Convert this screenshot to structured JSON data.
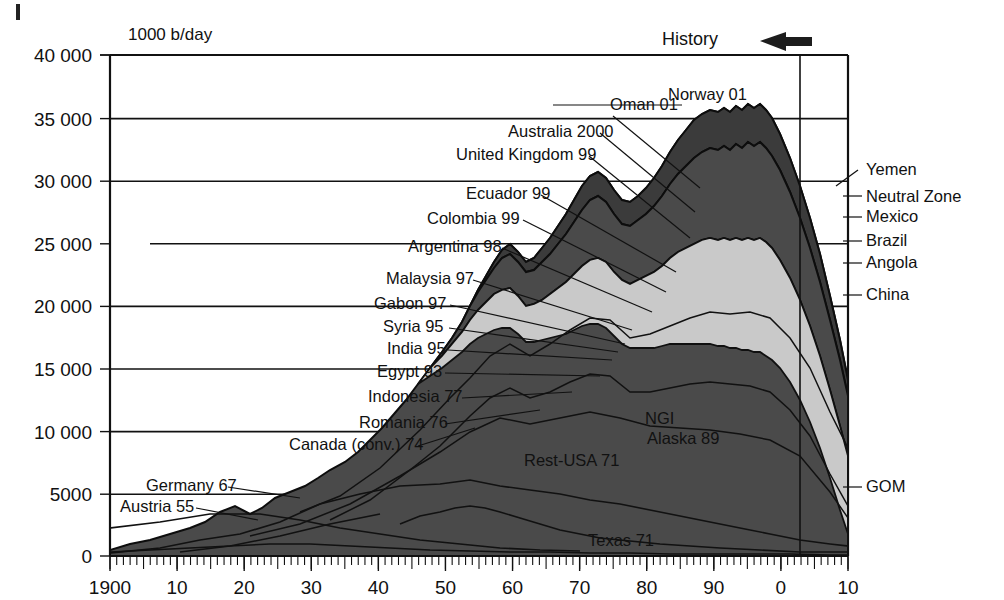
{
  "figure": {
    "axis_unit_label": "1000 b/day",
    "history_label": "History",
    "history_arrow_icon": "left-arrow-icon",
    "caption": ""
  },
  "chart_data": {
    "type": "area",
    "title": "",
    "subtitle": "",
    "xlabel": "",
    "ylabel": "1000 b/day",
    "ylim": [
      0,
      40000
    ],
    "xlim": [
      1900,
      2010
    ],
    "grid": true,
    "legend_position": "inline-callouts",
    "ytick_labels": [
      "0",
      "5000",
      "10 000",
      "15 000",
      "20 000",
      "25 000",
      "30 000",
      "35 000",
      "40 000"
    ],
    "ytick_values": [
      0,
      5000,
      10000,
      15000,
      20000,
      25000,
      30000,
      35000,
      40000
    ],
    "xtick_labels": [
      "1900",
      "10",
      "20",
      "30",
      "40",
      "50",
      "60",
      "70",
      "80",
      "90",
      "0",
      "10"
    ],
    "xtick_values": [
      1900,
      1910,
      1920,
      1930,
      1940,
      1950,
      1960,
      1970,
      1980,
      1990,
      2000,
      2010
    ],
    "minor_tick_interval_years": 1,
    "history_divider_year": 2003,
    "annotation_note": "Stacked world oil production by region with peak year labels",
    "left_callouts": [
      {
        "label": "Oman 01",
        "x": 610,
        "y": 110
      },
      {
        "label": "Australia 2000",
        "x": 508,
        "y": 137
      },
      {
        "label": "United Kingdom 99",
        "x": 456,
        "y": 160
      },
      {
        "label": "Ecuador 99",
        "x": 466,
        "y": 199
      },
      {
        "label": "Colombia 99",
        "x": 427,
        "y": 224
      },
      {
        "label": "Argentina 98",
        "x": 408,
        "y": 252
      },
      {
        "label": "Malaysia 97",
        "x": 386,
        "y": 284
      },
      {
        "label": "Gabon 97",
        "x": 374,
        "y": 309
      },
      {
        "label": "Syria 95",
        "x": 383,
        "y": 332
      },
      {
        "label": "India 95",
        "x": 387,
        "y": 354
      },
      {
        "label": "Egypt 93",
        "x": 377,
        "y": 377
      },
      {
        "label": "Indonesia 77",
        "x": 368,
        "y": 402
      },
      {
        "label": "Romania 76",
        "x": 359,
        "y": 428
      },
      {
        "label": "Canada (conv.) 74",
        "x": 289,
        "y": 450
      },
      {
        "label": "Germany 67",
        "x": 146,
        "y": 491
      },
      {
        "label": "Austria 55",
        "x": 120,
        "y": 512
      }
    ],
    "top_callouts": [
      {
        "label": "Norway 01",
        "x": 668,
        "y": 100
      }
    ],
    "inner_labels": [
      {
        "label": "NGI",
        "x": 645,
        "y": 424
      },
      {
        "label": "Alaska 89",
        "x": 647,
        "y": 444
      },
      {
        "label": "Rest-USA 71",
        "x": 524,
        "y": 466
      },
      {
        "label": "Texas 71",
        "x": 588,
        "y": 546
      }
    ],
    "right_labels": [
      {
        "label": "Yemen",
        "x": 866,
        "y": 175
      },
      {
        "label": "Neutral Zone",
        "x": 866,
        "y": 202
      },
      {
        "label": "Mexico",
        "x": 866,
        "y": 222
      },
      {
        "label": "Brazil",
        "x": 866,
        "y": 246
      },
      {
        "label": "Angola",
        "x": 866,
        "y": 268
      },
      {
        "label": "China",
        "x": 866,
        "y": 300
      },
      {
        "label": "GOM",
        "x": 866,
        "y": 492
      }
    ],
    "series": [
      {
        "name": "Texas 71",
        "peak_year": 1971,
        "peak_value": 3600
      },
      {
        "name": "Rest-USA 71",
        "peak_year": 1971,
        "peak_value": 4900
      },
      {
        "name": "Alaska 89",
        "peak_year": 1989,
        "peak_value": 2000
      },
      {
        "name": "NGI",
        "peak_year": 1985,
        "peak_value": 900
      },
      {
        "name": "GOM",
        "peak_year": 2003,
        "peak_value": 1500
      },
      {
        "name": "Austria 55",
        "peak_year": 1955,
        "peak_value": 60
      },
      {
        "name": "Germany 67",
        "peak_year": 1967,
        "peak_value": 160
      },
      {
        "name": "Canada (conv.) 74",
        "peak_year": 1974,
        "peak_value": 1800
      },
      {
        "name": "Romania 76",
        "peak_year": 1976,
        "peak_value": 310
      },
      {
        "name": "Indonesia 77",
        "peak_year": 1977,
        "peak_value": 1700
      },
      {
        "name": "Egypt 93",
        "peak_year": 1993,
        "peak_value": 940
      },
      {
        "name": "India 95",
        "peak_year": 1995,
        "peak_value": 780
      },
      {
        "name": "Syria 95",
        "peak_year": 1995,
        "peak_value": 600
      },
      {
        "name": "Gabon 97",
        "peak_year": 1997,
        "peak_value": 370
      },
      {
        "name": "Malaysia 97",
        "peak_year": 1997,
        "peak_value": 720
      },
      {
        "name": "Argentina 98",
        "peak_year": 1998,
        "peak_value": 900
      },
      {
        "name": "Colombia 99",
        "peak_year": 1999,
        "peak_value": 820
      },
      {
        "name": "Ecuador 99",
        "peak_year": 1999,
        "peak_value": 390
      },
      {
        "name": "United Kingdom 99",
        "peak_year": 1999,
        "peak_value": 2900
      },
      {
        "name": "Australia 2000",
        "peak_year": 2000,
        "peak_value": 800
      },
      {
        "name": "Oman 01",
        "peak_year": 2001,
        "peak_value": 960
      },
      {
        "name": "Norway 01",
        "peak_year": 2001,
        "peak_value": 3400
      },
      {
        "name": "China",
        "peak_year": 2003,
        "peak_value": 3400
      },
      {
        "name": "Angola",
        "peak_year": 2010,
        "peak_value": 1900
      },
      {
        "name": "Brazil",
        "peak_year": 2010,
        "peak_value": 2100
      },
      {
        "name": "Mexico",
        "peak_year": 2004,
        "peak_value": 3400
      },
      {
        "name": "Neutral Zone",
        "peak_year": 2005,
        "peak_value": 600
      },
      {
        "name": "Yemen",
        "peak_year": 2002,
        "peak_value": 450
      }
    ],
    "total_stack": {
      "x": [
        1900,
        1905,
        1910,
        1915,
        1920,
        1925,
        1930,
        1935,
        1940,
        1945,
        1950,
        1955,
        1960,
        1965,
        1970,
        1973,
        1975,
        1979,
        1982,
        1985,
        1988,
        1990,
        1993,
        1996,
        1999,
        2001,
        2003,
        2005,
        2007,
        2010
      ],
      "y": [
        420,
        700,
        1050,
        1250,
        1900,
        2700,
        3900,
        4200,
        5600,
        5800,
        9500,
        13000,
        17500,
        23000,
        30000,
        33500,
        31000,
        34500,
        30500,
        31500,
        34000,
        34500,
        33000,
        35000,
        36000,
        36500,
        36000,
        33000,
        27000,
        18000
      ]
    }
  }
}
